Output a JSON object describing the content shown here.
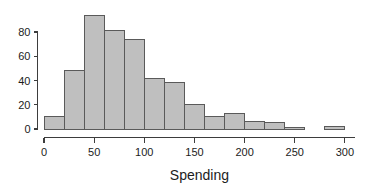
{
  "figure": {
    "width": 377,
    "height": 190,
    "background_color": "#ffffff"
  },
  "chart_data": {
    "type": "bar",
    "title": "",
    "subtitle": "",
    "xlabel": "Spending",
    "ylabel": "",
    "xlim": [
      0,
      310
    ],
    "ylim": [
      0,
      97
    ],
    "grid": false,
    "legend": null,
    "bin_width": 20,
    "bin_edges": [
      0,
      20,
      40,
      60,
      80,
      100,
      120,
      140,
      160,
      180,
      200,
      220,
      240,
      260,
      280,
      300
    ],
    "categories": [
      "0-20",
      "20-40",
      "40-60",
      "60-80",
      "80-100",
      "100-120",
      "120-140",
      "140-160",
      "160-180",
      "180-200",
      "200-220",
      "220-240",
      "240-260",
      "260-280",
      "280-300"
    ],
    "values": [
      10,
      48,
      94,
      81,
      74,
      42,
      38,
      20,
      10,
      13,
      6,
      5,
      1,
      0,
      2
    ],
    "bar_fill_color": "#bfbfbf",
    "bar_edge_color": "#5a5a5a",
    "axis_color": "#3d3d3d",
    "text_color": "#1c1c1c",
    "xticks": [
      0,
      50,
      100,
      150,
      200,
      250,
      300
    ],
    "xtick_labels": [
      "0",
      "50",
      "100",
      "150",
      "200",
      "250",
      "300"
    ],
    "yticks": [
      0,
      20,
      40,
      60,
      80
    ],
    "ytick_labels": [
      "0",
      "20",
      "40",
      "60",
      "80"
    ]
  }
}
